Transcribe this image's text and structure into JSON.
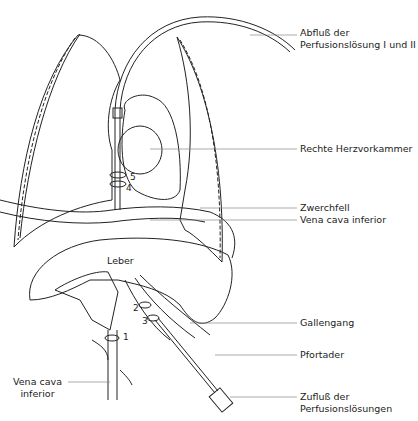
{
  "labels": {
    "abfluss_1": "Abfluß der",
    "abfluss_2": "Perfusionslösung I und II",
    "herzvorkammer": "Rechte Herzvorkammer",
    "zwerchfell": "Zwerchfell",
    "vena_cava_right": "Vena cava inferior",
    "leber": "Leber",
    "gallengang": "Gallengang",
    "pfortader": "Pfortader",
    "zufluss_1": "Zufluß der",
    "zufluss_2": "Perfusionslösungen",
    "vena_cava_left_1": "Vena cava",
    "vena_cava_left_2": "inferior"
  },
  "ligature_numbers": [
    "1",
    "2",
    "3",
    "4",
    "5"
  ],
  "colors": {
    "line": "#222222",
    "leader": "#888888",
    "background": "#ffffff"
  }
}
